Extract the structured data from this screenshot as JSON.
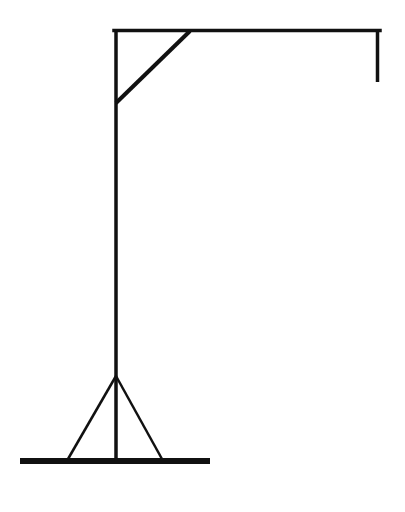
{
  "drawing": {
    "subject": "hangman-gallows",
    "stroke_color": "#111111",
    "background": "#ffffff",
    "parts": {
      "base": {
        "x1": 20,
        "y1": 461,
        "x2": 210,
        "y2": 461,
        "width": 6
      },
      "pole": {
        "x1": 116,
        "y1": 29,
        "x2": 116,
        "y2": 461,
        "width": 3.5
      },
      "beam": {
        "x1": 114,
        "y1": 30.5,
        "x2": 380,
        "y2": 30.5,
        "width": 3.5
      },
      "brace": {
        "x1": 116,
        "y1": 103,
        "x2": 190,
        "y2": 31,
        "width": 4
      },
      "rope": {
        "x1": 377.5,
        "y1": 29,
        "x2": 377.5,
        "y2": 82,
        "width": 3.5
      },
      "leg_left": {
        "x1": 116,
        "y1": 376,
        "x2": 68,
        "y2": 459,
        "width": 2.5
      },
      "leg_right": {
        "x1": 116,
        "y1": 376,
        "x2": 162,
        "y2": 459,
        "width": 2.5
      }
    }
  }
}
